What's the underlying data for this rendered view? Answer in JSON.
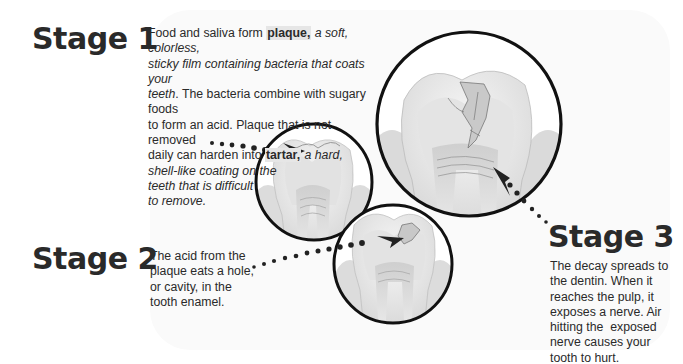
{
  "diagram": {
    "topic": "Stages of tooth decay",
    "stages": [
      {
        "title": "Stage 1",
        "text_runs": [
          {
            "text": "Food and saliva form ",
            "style": "normal"
          },
          {
            "text": "plaque,",
            "style": "bold-highlight"
          },
          {
            "text": " a soft, colorless, sticky film containing bacteria that coats your teeth",
            "style": "italic"
          },
          {
            "text": ". The bacteria combine with sugary foods to form an acid. Plaque that is not removed daily can harden into ",
            "style": "normal"
          },
          {
            "text": "tartar,",
            "style": "bold-highlight"
          },
          {
            "text": " a hard, shell-like coating on the teeth that is difficult to remove.",
            "style": "italic"
          }
        ],
        "lines": [
          "Food and saliva form plaque, a soft, colorless,",
          "sticky film containing bacteria that coats your",
          "teeth. The bacteria combine with sugary foods",
          "to form an acid. Plaque that is not removed",
          "daily can harden into tartar, a hard,",
          "shell-like coating on the",
          "teeth that is difficult",
          "to remove."
        ],
        "illustration": "tooth-with-plaque-on-surface"
      },
      {
        "title": "Stage 2",
        "lines": [
          "The acid from the",
          "plaque eats a hole,",
          "or cavity, in the",
          "tooth enamel."
        ],
        "illustration": "tooth-with-cavity-in-enamel"
      },
      {
        "title": "Stage 3",
        "lines": [
          "The decay spreads to",
          "the dentin. When it",
          "reaches the pulp, it",
          "exposes a nerve. Air",
          "hitting the  exposed",
          "nerve causes your",
          "tooth to hurt."
        ],
        "illustration": "tooth-with-decay-reaching-pulp"
      }
    ],
    "colors": {
      "text": "#2a2a2a",
      "outline": "#111111",
      "highlight": "#e6e6e6",
      "tooth": "#eeeeee",
      "dentin": "#dddddd",
      "pulp": "#c8c8c8"
    }
  }
}
